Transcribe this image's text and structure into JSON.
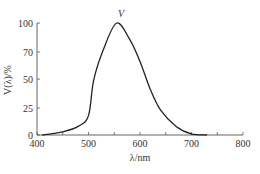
{
  "chart_data": {
    "type": "line",
    "title": "",
    "xlabel": "λ/nm",
    "ylabel": "V(λ)/%",
    "xlim": [
      400,
      800
    ],
    "ylim": [
      0,
      100
    ],
    "x_ticks": [
      400,
      500,
      600,
      700,
      800
    ],
    "x_minor_ticks": [
      450,
      550,
      650,
      750
    ],
    "y_ticks": [
      0,
      25,
      50,
      70,
      100
    ],
    "grid": false,
    "legend": null,
    "annotations": [
      {
        "text": "V",
        "x": 555,
        "y": 100,
        "position": "above-peak"
      }
    ],
    "series": [
      {
        "name": "V",
        "x": [
          410,
          450,
          480,
          500,
          510,
          530,
          555,
          580,
          600,
          620,
          640,
          670,
          700,
          730
        ],
        "values": [
          0,
          3,
          8,
          18,
          49,
          74,
          100,
          83,
          63,
          41,
          23,
          8,
          1,
          0
        ]
      }
    ]
  },
  "labels": {
    "xlabel": "λ/nm",
    "ylabel": "V(λ)/%",
    "annotation": "V",
    "x_tick_labels": [
      "400",
      "500",
      "600",
      "700",
      "800"
    ],
    "y_tick_labels": [
      "0",
      "25",
      "50",
      "70",
      "100"
    ]
  },
  "colors": {
    "line": "#222222",
    "axis": "#555555",
    "text": "#333333"
  }
}
